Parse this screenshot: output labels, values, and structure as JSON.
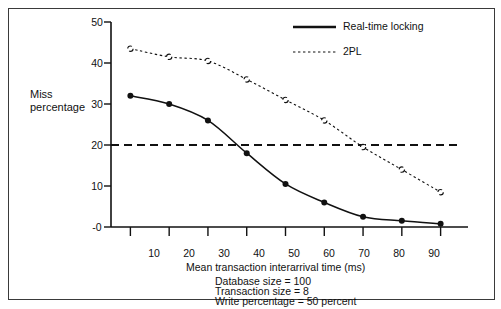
{
  "figure": {
    "border_color": "#3a3a3a",
    "background": "#ffffff",
    "ink_color": "#111111"
  },
  "chart_data": {
    "type": "line",
    "title": "",
    "xlabel": "Mean transaction interarrival time (ms)",
    "ylabel": "Miss percentage",
    "ylabel_lines": [
      "Miss",
      "percentage"
    ],
    "x": [
      10,
      20,
      30,
      40,
      50,
      60,
      70,
      80,
      90
    ],
    "xtick_labels": [
      "10",
      "20",
      "30",
      "40",
      "50",
      "60",
      "70",
      "80",
      "90"
    ],
    "ytick_labels": [
      "50",
      "40",
      "30",
      "20",
      "10",
      "-0"
    ],
    "yticks": [
      50,
      40,
      30,
      20,
      10,
      0
    ],
    "xlim": [
      5,
      95
    ],
    "ylim": [
      0,
      50
    ],
    "grid": false,
    "legend_position": "top-right",
    "series": [
      {
        "name": "Real-time locking",
        "style": "solid",
        "marker": "filled-circle",
        "color": "#111111",
        "values": [
          32.0,
          30.0,
          26.0,
          18.0,
          10.5,
          6.0,
          2.5,
          1.5,
          0.8
        ]
      },
      {
        "name": "2PL",
        "style": "dotted",
        "marker": "open-circle",
        "color": "#111111",
        "values": [
          43.5,
          41.5,
          40.5,
          36.0,
          31.0,
          26.0,
          19.5,
          14.0,
          8.5
        ]
      }
    ],
    "reference_lines": [
      {
        "name": "miss-percentage-threshold",
        "orientation": "horizontal",
        "value": 20,
        "style": "dashed",
        "color": "#111111"
      }
    ],
    "annotations": [
      "Database size = 100",
      "Transaction size = 8",
      "Write percentage = 50 percent"
    ]
  },
  "legend": {
    "entries": [
      {
        "label": "Real-time locking",
        "style": "solid"
      },
      {
        "label": "2PL",
        "style": "dotted"
      }
    ]
  },
  "caption": {
    "lines": [
      "Database size = 100",
      "Transaction size = 8",
      "Write percentage = 50 percent"
    ]
  }
}
